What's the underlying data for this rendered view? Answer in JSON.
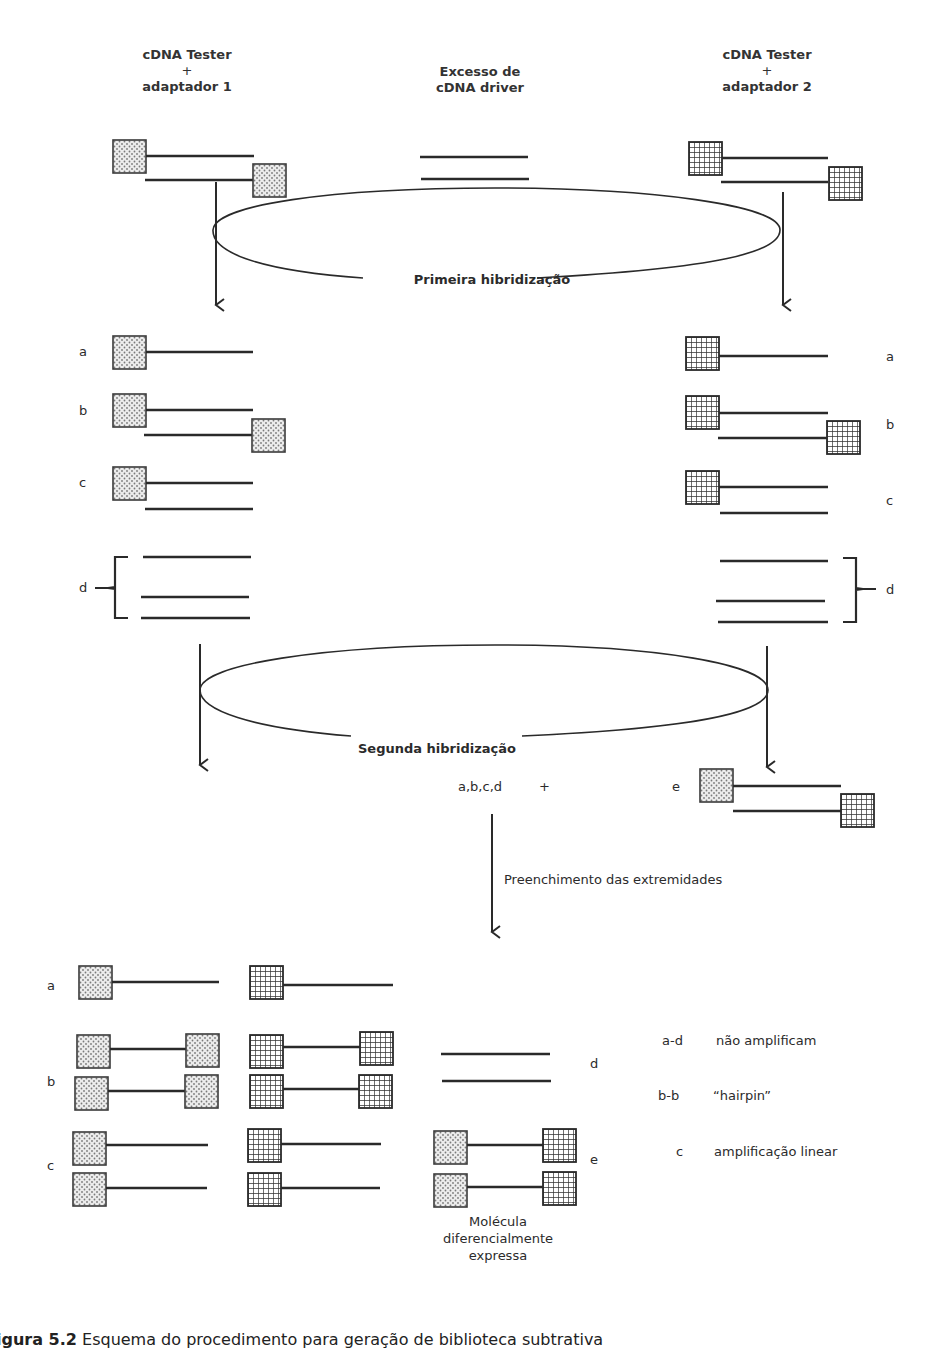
{
  "header": {
    "left": {
      "line1": "cDNA Tester",
      "line2": "+",
      "line3": "adaptador 1"
    },
    "center": {
      "line1": "Excesso de",
      "line2": "cDNA driver"
    },
    "right": {
      "line1": "cDNA Tester",
      "line2": "+",
      "line3": "adaptador 2"
    }
  },
  "steps": {
    "first_hybridization": "Primeira hibridização",
    "second_hybridization": "Segunda hibridização",
    "fill_in": "Preenchimento das extremidades",
    "combined_set": "a,b,c,d",
    "plus": "+",
    "e_label": "e"
  },
  "after_first": {
    "left_labels": [
      "a",
      "b",
      "c",
      "d"
    ],
    "right_labels": [
      "a",
      "b",
      "c",
      "d"
    ]
  },
  "products": {
    "labels": [
      "a",
      "b",
      "c"
    ],
    "d_label": "d",
    "e_label": "e",
    "molecule_caption": {
      "line1": "Molécula",
      "line2": "diferencialmente",
      "line3": "expressa"
    }
  },
  "legend": [
    {
      "key": "a-d",
      "value": "não amplificam"
    },
    {
      "key": "b-b",
      "value": "“hairpin”"
    },
    {
      "key": "c",
      "value": "amplificação linear"
    }
  ],
  "caption": {
    "number": "igura 5.2",
    "text": "Esquema do procedimento para geração de biblioteca subtrativa"
  },
  "colors": {
    "line": "#2a2a2a",
    "dot_fill": "#e4e4e4",
    "text": "#2b2b2b"
  },
  "adapters": {
    "adapter_1": "dotted-square",
    "adapter_2": "grid-square"
  }
}
